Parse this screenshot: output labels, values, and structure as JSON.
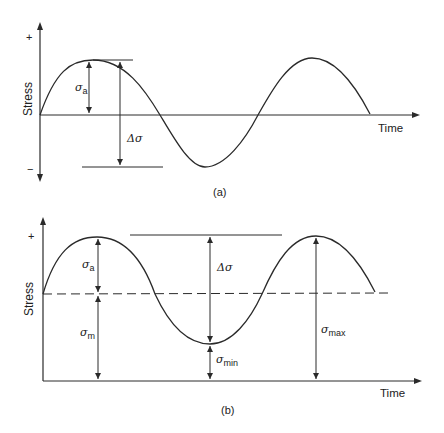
{
  "panel_a": {
    "caption": "(a)",
    "y_axis_label": "Stress",
    "x_axis_label": "Time",
    "plus_sign": "+",
    "minus_sign": "−",
    "sigma": "σ",
    "sigma_a_sub": "a",
    "delta_sigma": "Δσ"
  },
  "panel_b": {
    "caption": "(b)",
    "y_axis_label": "Stress",
    "x_axis_label": "Time",
    "plus_sign": "+",
    "sigma": "σ",
    "sigma_a_sub": "a",
    "sigma_m_sub": "m",
    "sigma_min_sub": "min",
    "sigma_max_sub": "max",
    "delta_sigma": "Δσ"
  },
  "colors": {
    "line": "#2a2a2a",
    "text": "#222222"
  }
}
